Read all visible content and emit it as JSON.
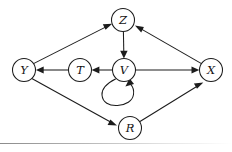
{
  "figure": {
    "type": "directed-graph",
    "title": "",
    "background_color": "#ffffff",
    "stroke_color": "#1c1c1c",
    "width": 232,
    "height": 152
  },
  "nodes": [
    {
      "id": "Z",
      "label": "Z",
      "x": 123,
      "y": 20,
      "r": 11.5
    },
    {
      "id": "Y",
      "label": "Y",
      "x": 24,
      "y": 70,
      "r": 11.5
    },
    {
      "id": "T",
      "label": "T",
      "x": 80,
      "y": 70,
      "r": 11.5
    },
    {
      "id": "V",
      "label": "V",
      "x": 124,
      "y": 70,
      "r": 11.5
    },
    {
      "id": "X",
      "label": "X",
      "x": 211,
      "y": 70,
      "r": 11.5
    },
    {
      "id": "R",
      "label": "R",
      "x": 130,
      "y": 128,
      "r": 11.5
    }
  ],
  "edges": [
    {
      "id": "Y-Z",
      "from": "Y",
      "to": "Z",
      "label": "",
      "directed": true
    },
    {
      "id": "X-Z",
      "from": "X",
      "to": "Z",
      "label": "",
      "directed": true
    },
    {
      "id": "Z-V",
      "from": "Z",
      "to": "V",
      "label": "",
      "directed": true
    },
    {
      "id": "V-T",
      "from": "V",
      "to": "T",
      "label": "",
      "directed": true
    },
    {
      "id": "T-Y",
      "from": "T",
      "to": "Y",
      "label": "",
      "directed": true
    },
    {
      "id": "V-X",
      "from": "V",
      "to": "X",
      "label": "",
      "directed": true
    },
    {
      "id": "Y-R",
      "from": "Y",
      "to": "R",
      "label": "",
      "directed": true
    },
    {
      "id": "R-X",
      "from": "R",
      "to": "X",
      "label": "",
      "directed": true
    },
    {
      "id": "V-V",
      "from": "V",
      "to": "V",
      "label": "",
      "directed": true,
      "self_loop": true
    }
  ],
  "footer": {
    "rule_visible": true
  }
}
